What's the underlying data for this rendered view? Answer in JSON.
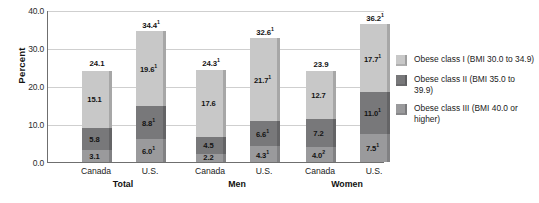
{
  "chart_data": {
    "type": "bar",
    "title": "",
    "subtitle": "",
    "xlabel": "",
    "ylabel": "Percent",
    "ylim": [
      0,
      40
    ],
    "yticks": [
      "0.0",
      "10.0",
      "20.0",
      "30.0",
      "40.0"
    ],
    "ytick_values": [
      0,
      10,
      20,
      30,
      40
    ],
    "grid": true,
    "stacked": true,
    "legend_position": "right",
    "categories": [
      "Canada",
      "U.S.",
      "Canada",
      "U.S.",
      "Canada",
      "U.S."
    ],
    "groups": [
      "Total",
      "Men",
      "Women"
    ],
    "series": [
      {
        "name": "Obese class III (BMI 40.0 or higher)",
        "color": "#9a9a9c",
        "values": [
          3.1,
          6.0,
          2.2,
          4.3,
          4.0,
          7.5
        ],
        "labels": [
          "3.1",
          "6.0",
          "2.2",
          "4.3",
          "4.0",
          "7.5"
        ],
        "marks": [
          "",
          "1",
          "",
          "1",
          "2",
          "1"
        ]
      },
      {
        "name": "Obese class II (BMI 35.0 to 39.9)",
        "color": "#78787a",
        "values": [
          5.8,
          8.8,
          4.5,
          6.6,
          7.2,
          11.0
        ],
        "labels": [
          "5.8",
          "8.8",
          "4.5",
          "6.6",
          "7.2",
          "11.0"
        ],
        "marks": [
          "",
          "1",
          "",
          "1",
          "",
          "1"
        ]
      },
      {
        "name": "Obese class I (BMI 30.0 to 34.9)",
        "color": "#c8c8c8",
        "values": [
          15.1,
          19.6,
          17.6,
          21.7,
          12.7,
          17.7
        ],
        "labels": [
          "15.1",
          "19.6",
          "17.6",
          "21.7",
          "12.7",
          "17.7"
        ],
        "marks": [
          "",
          "1",
          "",
          "1",
          "",
          "1"
        ]
      }
    ],
    "totals": [
      24.1,
      34.4,
      24.3,
      32.6,
      23.9,
      36.2
    ],
    "total_labels": [
      "24.1",
      "34.4",
      "24.3",
      "32.6",
      "23.9",
      "36.2"
    ],
    "total_marks": [
      "",
      "1",
      "1",
      "1",
      "",
      "1"
    ]
  },
  "legend": {
    "items": [
      {
        "label": "Obese class I (BMI 30.0 to 34.9)",
        "color": "#c8c8c8"
      },
      {
        "label": "Obese class II (BMI 35.0 to 39.9)",
        "color": "#78787a"
      },
      {
        "label": "Obese class III (BMI 40.0 or higher)",
        "color": "#9a9a9c"
      }
    ]
  }
}
